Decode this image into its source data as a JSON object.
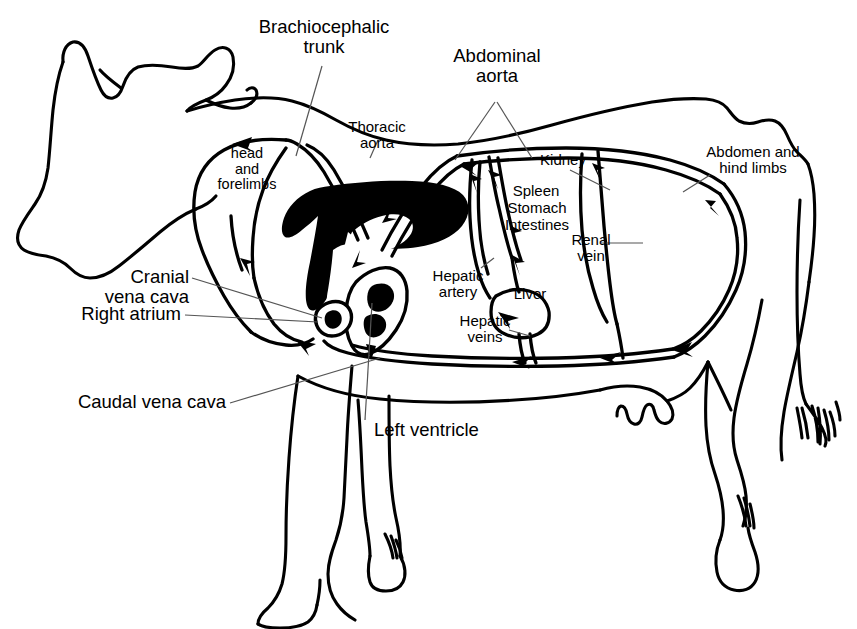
{
  "figure": {
    "line_color": "#000000",
    "fill_color": "#000000",
    "background_color": "#ffffff",
    "leader_color": "#444444"
  },
  "labels": {
    "brachiocephalic_trunk": "Brachiocephalic\ntrunk",
    "abdominal_aorta": "Abdominal\naorta",
    "thoracic_aorta": "Thoracic\naorta",
    "head_and_forelimbs": "head\nand\nforelimbs",
    "kidney": "Kidney",
    "spleen": "Spleen",
    "stomach": "Stomach",
    "intestines": "Intestines",
    "renal_vein": "Renal\nvein",
    "abdomen_and_hind_limbs": "Abdomen and\nhind limbs",
    "hepatic_artery": "Hepatic\nartery",
    "hepatic_veins": "Hepatic\nveins",
    "liver": "Liver",
    "cranial_vena_cava": "Cranial\nvena cava",
    "right_atrium": "Right atrium",
    "caudal_vena_cava": "Caudal vena cava",
    "left_ventricle": "Left ventricle"
  },
  "structures": [
    {
      "name": "brachiocephalic-trunk",
      "type": "artery"
    },
    {
      "name": "abdominal-aorta",
      "type": "artery"
    },
    {
      "name": "thoracic-aorta",
      "type": "artery"
    },
    {
      "name": "hepatic-artery",
      "type": "artery"
    },
    {
      "name": "head-and-forelimbs",
      "type": "capillary-bed"
    },
    {
      "name": "kidney",
      "type": "organ"
    },
    {
      "name": "spleen",
      "type": "organ"
    },
    {
      "name": "stomach",
      "type": "organ"
    },
    {
      "name": "intestines",
      "type": "organ"
    },
    {
      "name": "liver",
      "type": "organ"
    },
    {
      "name": "abdomen-and-hind-limbs",
      "type": "capillary-bed"
    },
    {
      "name": "renal-vein",
      "type": "vein"
    },
    {
      "name": "hepatic-veins",
      "type": "vein"
    },
    {
      "name": "cranial-vena-cava",
      "type": "vein"
    },
    {
      "name": "caudal-vena-cava",
      "type": "vein"
    },
    {
      "name": "right-atrium",
      "type": "heart-chamber"
    },
    {
      "name": "left-ventricle",
      "type": "heart-chamber"
    }
  ]
}
